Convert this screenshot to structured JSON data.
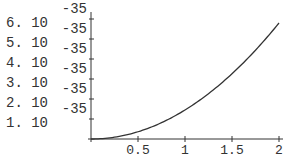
{
  "chart_data": {
    "type": "line",
    "title": "",
    "xlabel": "",
    "ylabel": "",
    "xlim": [
      0,
      2
    ],
    "ylim": [
      0,
      6.2e-35
    ],
    "grid": false,
    "legend": null,
    "x_ticks": [
      {
        "value": 0.5,
        "label": "0.5"
      },
      {
        "value": 1,
        "label": "1"
      },
      {
        "value": 1.5,
        "label": "1.5"
      },
      {
        "value": 2,
        "label": "2"
      }
    ],
    "y_ticks": [
      {
        "value": 1e-35,
        "mantissa": "1.",
        "base": "10",
        "exponent": "-35"
      },
      {
        "value": 2e-35,
        "mantissa": "2.",
        "base": "10",
        "exponent": "-35"
      },
      {
        "value": 3e-35,
        "mantissa": "3.",
        "base": "10",
        "exponent": "-35"
      },
      {
        "value": 4e-35,
        "mantissa": "4.",
        "base": "10",
        "exponent": "-35"
      },
      {
        "value": 5e-35,
        "mantissa": "5.",
        "base": "10",
        "exponent": "-35"
      },
      {
        "value": 6e-35,
        "mantissa": "6.",
        "base": "10",
        "exponent": "-35"
      }
    ],
    "series": [
      {
        "name": "curve",
        "color": "#333333",
        "x": [
          0,
          0.25,
          0.5,
          0.75,
          1.0,
          1.25,
          1.5,
          1.75,
          2.0
        ],
        "y": [
          0,
          9e-37,
          3.6e-36,
          8.2e-36,
          1.45e-35,
          2.27e-35,
          3.27e-35,
          4.45e-35,
          5.8e-35
        ]
      }
    ]
  }
}
